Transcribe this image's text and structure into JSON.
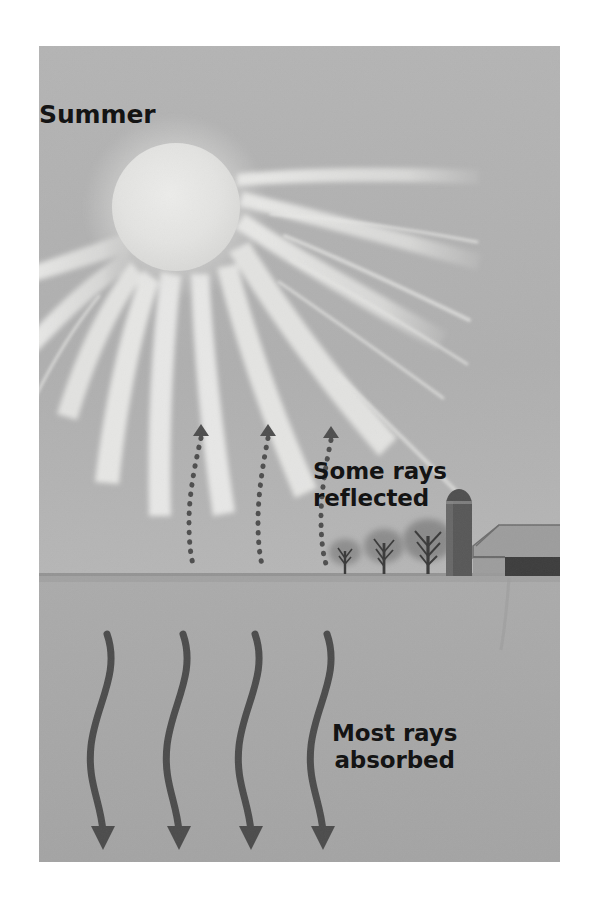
{
  "figure": {
    "kind": "illustration",
    "frame": {
      "x": 39,
      "y": 46,
      "width": 521,
      "height": 816
    },
    "page_background": "#ffffff"
  },
  "labels": {
    "season": "Summer",
    "reflected": "Some rays\nreflected",
    "absorbed": "Most rays\nabsorbed"
  },
  "colors": {
    "sky": "#b0b0b0",
    "ground": "#a7a7a7",
    "horizon_line": "#8e8e8e",
    "sun": "#e2e2e0",
    "ray": "#e8e8e6",
    "text": "#141414",
    "arrow_dark": "#4e4e4e",
    "tree_canopy": "#8c8c8c",
    "tree_trunk": "#3a3a3a",
    "barn_dark": "#3d3d3d",
    "barn_roof": "#9a9a9a",
    "silo": "#595959"
  },
  "scene": {
    "sun": {
      "cx": 137,
      "cy": 161,
      "r": 64,
      "label": "sun-disc"
    },
    "horizon_y": 529,
    "rays": [
      {
        "name": "ray-left-far",
        "angle": 196,
        "length": 300,
        "width": 26
      },
      {
        "name": "ray-left-outer",
        "angle": 208,
        "length": 265,
        "width": 22
      },
      {
        "name": "ray-left-mid",
        "angle": 228,
        "length": 285,
        "width": 26
      },
      {
        "name": "ray-left-inner",
        "angle": 248,
        "length": 300,
        "width": 24
      },
      {
        "name": "ray-down-left",
        "angle": 266,
        "length": 300,
        "width": 22
      },
      {
        "name": "ray-down",
        "angle": 283,
        "length": 300,
        "width": 22
      },
      {
        "name": "ray-down-right",
        "angle": 298,
        "length": 320,
        "width": 26
      },
      {
        "name": "ray-right-mid",
        "angle": 316,
        "length": 330,
        "width": 26
      },
      {
        "name": "ray-right-out",
        "angle": 331,
        "length": 330,
        "width": 22
      },
      {
        "name": "ray-right-far",
        "angle": 344,
        "length": 330,
        "width": 18
      },
      {
        "name": "ray-right-top",
        "angle": 353,
        "length": 300,
        "width": 16
      }
    ],
    "reflected_arrows": [
      {
        "name": "reflected-arrow-1",
        "x": 160,
        "top_y": 388,
        "bottom_y": 522
      },
      {
        "name": "reflected-arrow-2",
        "x": 228,
        "top_y": 388,
        "bottom_y": 522
      },
      {
        "name": "reflected-arrow-3",
        "x": 291,
        "top_y": 390,
        "bottom_y": 518
      }
    ],
    "absorbed_arrows": [
      {
        "name": "absorbed-arrow-1",
        "x": 73,
        "top_y": 588,
        "bottom_y": 790
      },
      {
        "name": "absorbed-arrow-2",
        "x": 148,
        "top_y": 588,
        "bottom_y": 790
      },
      {
        "name": "absorbed-arrow-3",
        "x": 220,
        "top_y": 588,
        "bottom_y": 790
      },
      {
        "name": "absorbed-arrow-4",
        "x": 293,
        "top_y": 588,
        "bottom_y": 790
      }
    ],
    "trees": [
      {
        "name": "tree-small",
        "cx": 306,
        "base_y": 528,
        "canopy_r": 15,
        "height": 34
      },
      {
        "name": "tree-medium",
        "cx": 344,
        "base_y": 528,
        "canopy_r": 19,
        "height": 44
      },
      {
        "name": "tree-large",
        "cx": 387,
        "base_y": 528,
        "canopy_r": 24,
        "height": 54
      }
    ],
    "farm": {
      "silo": {
        "name": "silo",
        "x": 406,
        "y": 444,
        "width": 28,
        "height": 85
      },
      "barn": {
        "name": "barn",
        "x": 431,
        "y": 478,
        "width": 115,
        "height": 51
      }
    }
  }
}
